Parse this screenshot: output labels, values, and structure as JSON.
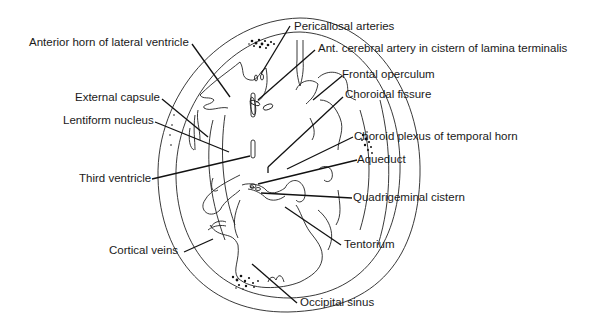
{
  "diagram": {
    "labels": {
      "pericallosal_arteries": "Pericallosal arteries",
      "anterior_horn": "Anterior horn of lateral ventricle",
      "ant_cerebral_artery": "Ant. cerebral artery in cistern of lamina terminalis",
      "frontal_operculum": "Frontal operculum",
      "external_capsule": "External capsule",
      "choroidal_fissure": "Choroidal fissure",
      "lentiform_nucleus": "Lentiform nucleus",
      "choroid_plexus": "Choroid plexus of  temporal horn",
      "third_ventricle": "Third ventricle",
      "aqueduct": "Aqueduct",
      "quadrigeminal_cistern": "Quadrigeminal cistern",
      "tentorium": "Tentorium",
      "cortical_veins": "Cortical veins",
      "occipital_sinus": "Occipital sinus"
    },
    "colors": {
      "line": "#1a1a1a",
      "background": "#ffffff"
    }
  }
}
